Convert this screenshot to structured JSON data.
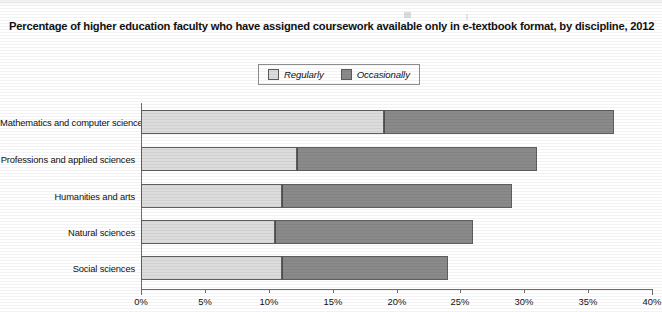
{
  "chart_data": {
    "type": "bar",
    "orientation": "horizontal",
    "stacked": true,
    "title": "Percentage of higher education faculty who have assigned coursework available only in e-textbook format, by discipline, 2012",
    "xlabel": "",
    "ylabel": "",
    "xlim": [
      0,
      40
    ],
    "xtick_labels": [
      "0%",
      "5%",
      "10%",
      "15%",
      "20%",
      "25%",
      "30%",
      "35%",
      "40%"
    ],
    "xtick_values": [
      0,
      5,
      10,
      15,
      20,
      25,
      30,
      35,
      40
    ],
    "grid": false,
    "legend_position": "top-center",
    "categories": [
      "Mathematics and computer science",
      "Professions and applied sciences",
      "Humanities and arts",
      "Natural sciences",
      "Social sciences"
    ],
    "series": [
      {
        "name": "Regularly",
        "color": "#dcdcdc",
        "values": [
          19.0,
          12.2,
          11.0,
          10.5,
          11.0
        ]
      },
      {
        "name": "Occasionally",
        "color": "#8a8a8a",
        "values": [
          18.0,
          18.8,
          18.0,
          15.5,
          13.0
        ]
      }
    ],
    "totals": [
      37.0,
      31.0,
      29.0,
      26.0,
      24.0
    ]
  },
  "legend": {
    "items": [
      {
        "label": "Regularly",
        "swatch": "light-gray-swatch"
      },
      {
        "label": "Occasionally",
        "swatch": "dark-gray-swatch"
      }
    ]
  },
  "colors": {
    "regularly": "#dcdcdc",
    "occasionally": "#8a8a8a",
    "axis": "#6d6d6d",
    "bar_border": "#5e5e5e",
    "background": "#ffffff"
  }
}
